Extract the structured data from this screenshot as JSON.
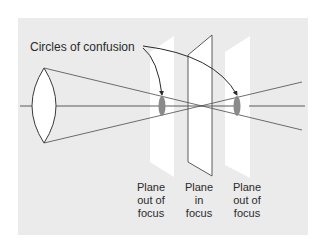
{
  "diagram": {
    "title_label": "Circles of confusion",
    "planes": [
      {
        "id": "left",
        "lines": [
          "Plane",
          "out of",
          "focus"
        ]
      },
      {
        "id": "center",
        "lines": [
          "Plane",
          "in",
          "focus"
        ]
      },
      {
        "id": "right",
        "lines": [
          "Plane",
          "out of",
          "focus"
        ]
      }
    ],
    "colors": {
      "background_panel": "#ebebeb",
      "plane_fill": "#ffffff",
      "line": "#4a4a4a",
      "circle_of_confusion": "#8a8a8a"
    }
  }
}
